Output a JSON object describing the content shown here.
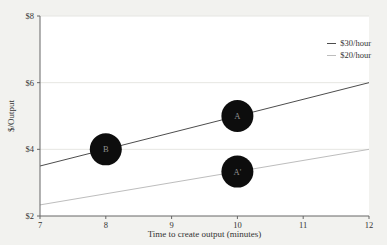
{
  "figure": {
    "background": "#f2f2ef",
    "plot_background": "#ffffff",
    "text_color": "#333333",
    "spine_color": "#666666",
    "grid_color": "#e6e6e2"
  },
  "chart_data": {
    "type": "line",
    "title": "",
    "xlabel": "Time to create output (minutes)",
    "ylabel": "$/Output",
    "xlim": [
      7,
      12
    ],
    "ylim": [
      2,
      8
    ],
    "grid": "horizontal",
    "grid_y": [
      4,
      6,
      8
    ],
    "x_ticks": [
      {
        "value": 7,
        "label": "7"
      },
      {
        "value": 8,
        "label": "8"
      },
      {
        "value": 9,
        "label": "9"
      },
      {
        "value": 10,
        "label": "10"
      },
      {
        "value": 11,
        "label": "11"
      },
      {
        "value": 12,
        "label": "12"
      }
    ],
    "y_ticks": [
      {
        "value": 2,
        "label": "$2"
      },
      {
        "value": 4,
        "label": "$4"
      },
      {
        "value": 6,
        "label": "$6"
      },
      {
        "value": 8,
        "label": "$8"
      }
    ],
    "series": [
      {
        "name": "$30/hour",
        "color": "#4d4d4d",
        "x": [
          7,
          12
        ],
        "y": [
          3.5,
          6.0
        ]
      },
      {
        "name": "$20/hour",
        "color": "#bdbdbd",
        "x": [
          7,
          12
        ],
        "y": [
          2.333,
          4.0
        ]
      }
    ],
    "annotated_points": [
      {
        "label": "B",
        "x": 8,
        "y": 4.0,
        "on_series": "$30/hour",
        "marker_color": "#0d0d0d",
        "label_color": "#8f8f8f"
      },
      {
        "label": "A",
        "x": 10,
        "y": 5.0,
        "on_series": "$30/hour",
        "marker_color": "#0d0d0d",
        "label_color": "#8f8f8f"
      },
      {
        "label": "A'",
        "x": 10,
        "y": 3.333,
        "on_series": "$20/hour",
        "marker_color": "#0d0d0d",
        "label_color": "#8f8f8f"
      }
    ],
    "legend": {
      "position": "upper right",
      "entries": [
        "$30/hour",
        "$20/hour"
      ]
    }
  }
}
